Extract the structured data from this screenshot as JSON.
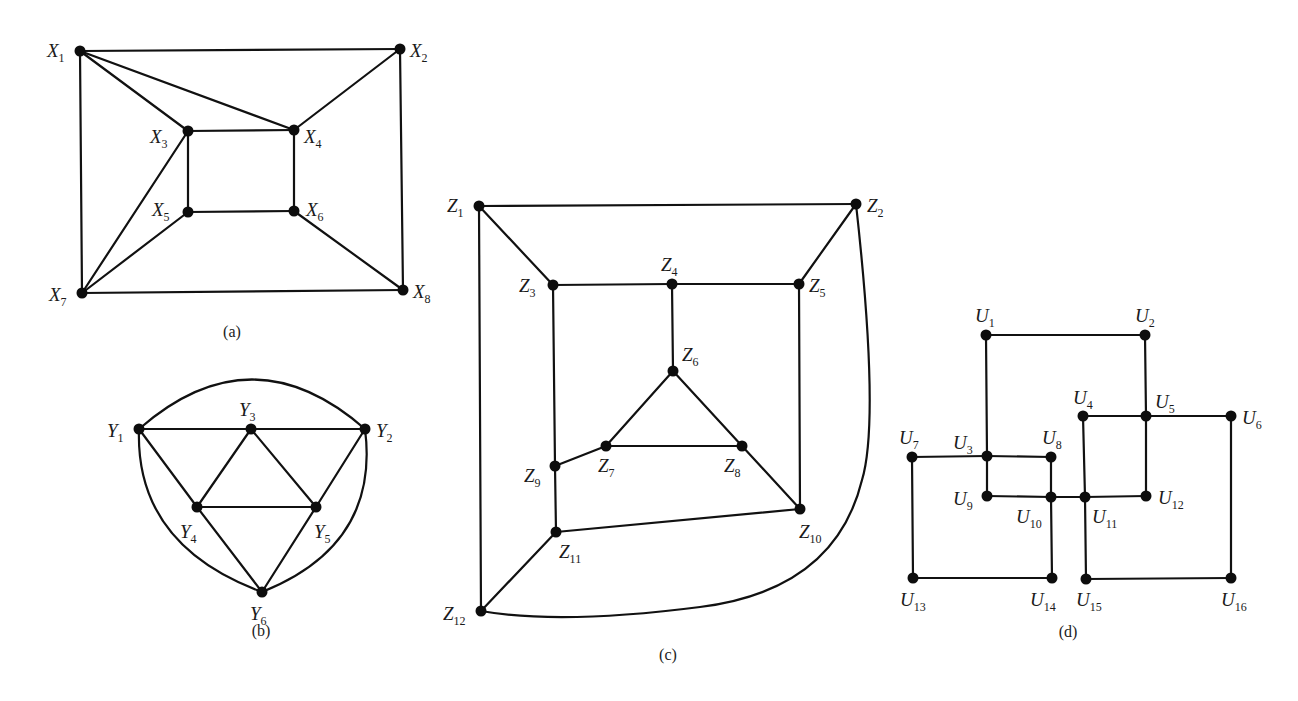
{
  "figure": {
    "graphs": [
      {
        "id": "a",
        "caption": "(a)",
        "caption_pos": [
          232,
          337
        ],
        "nodes": [
          {
            "name": "X",
            "sub": "1",
            "x": 80,
            "y": 51,
            "lx": 47,
            "ly": 57
          },
          {
            "name": "X",
            "sub": "2",
            "x": 400,
            "y": 49,
            "lx": 410,
            "ly": 57
          },
          {
            "name": "X",
            "sub": "3",
            "x": 188,
            "y": 131,
            "lx": 150,
            "ly": 143
          },
          {
            "name": "X",
            "sub": "4",
            "x": 294,
            "y": 130,
            "lx": 304,
            "ly": 143
          },
          {
            "name": "X",
            "sub": "5",
            "x": 188,
            "y": 212,
            "lx": 152,
            "ly": 216
          },
          {
            "name": "X",
            "sub": "6",
            "x": 294,
            "y": 211,
            "lx": 306,
            "ly": 216
          },
          {
            "name": "X",
            "sub": "7",
            "x": 82,
            "y": 293,
            "lx": 49,
            "ly": 301
          },
          {
            "name": "X",
            "sub": "8",
            "x": 403,
            "y": 290,
            "lx": 413,
            "ly": 298
          }
        ],
        "edges": [
          [
            0,
            1
          ],
          [
            0,
            2
          ],
          [
            0,
            3
          ],
          [
            0,
            6
          ],
          [
            1,
            3
          ],
          [
            1,
            7
          ],
          [
            2,
            3
          ],
          [
            2,
            4
          ],
          [
            2,
            6
          ],
          [
            3,
            5
          ],
          [
            4,
            5
          ],
          [
            4,
            6
          ],
          [
            5,
            7
          ],
          [
            6,
            7
          ]
        ]
      },
      {
        "id": "b",
        "caption": "(b)",
        "caption_pos": [
          261,
          636
        ],
        "nodes": [
          {
            "name": "Y",
            "sub": "1",
            "x": 139,
            "y": 429,
            "lx": 107,
            "ly": 437
          },
          {
            "name": "Y",
            "sub": "2",
            "x": 365,
            "y": 429,
            "lx": 376,
            "ly": 437
          },
          {
            "name": "Y",
            "sub": "3",
            "x": 251,
            "y": 429,
            "lx": 239,
            "ly": 416
          },
          {
            "name": "Y",
            "sub": "4",
            "x": 197,
            "y": 507,
            "lx": 180,
            "ly": 538
          },
          {
            "name": "Y",
            "sub": "5",
            "x": 316,
            "y": 507,
            "lx": 314,
            "ly": 538
          },
          {
            "name": "Y",
            "sub": "6",
            "x": 262,
            "y": 592,
            "lx": 250,
            "ly": 620
          }
        ],
        "edges": [
          [
            0,
            2
          ],
          [
            2,
            1
          ],
          [
            0,
            3
          ],
          [
            2,
            3
          ],
          [
            2,
            4
          ],
          [
            1,
            4
          ],
          [
            3,
            4
          ],
          [
            3,
            5
          ],
          [
            4,
            5
          ]
        ],
        "curves": [
          "M139,429 Q252,330 365,429",
          "M139,429 Q135,545 262,592",
          "M365,429 Q380,545 262,592"
        ]
      },
      {
        "id": "c",
        "caption": "(c)",
        "caption_pos": [
          668,
          660
        ],
        "nodes": [
          {
            "name": "Z",
            "sub": "1",
            "x": 479,
            "y": 206,
            "lx": 447,
            "ly": 212
          },
          {
            "name": "Z",
            "sub": "2",
            "x": 856,
            "y": 204,
            "lx": 867,
            "ly": 212
          },
          {
            "name": "Z",
            "sub": "3",
            "x": 553,
            "y": 285,
            "lx": 519,
            "ly": 292
          },
          {
            "name": "Z",
            "sub": "4",
            "x": 672,
            "y": 284,
            "lx": 661,
            "ly": 271
          },
          {
            "name": "Z",
            "sub": "5",
            "x": 799,
            "y": 284,
            "lx": 809,
            "ly": 292
          },
          {
            "name": "Z",
            "sub": "6",
            "x": 673,
            "y": 371,
            "lx": 682,
            "ly": 361
          },
          {
            "name": "Z",
            "sub": "7",
            "x": 606,
            "y": 446,
            "lx": 598,
            "ly": 472
          },
          {
            "name": "Z",
            "sub": "8",
            "x": 742,
            "y": 446,
            "lx": 724,
            "ly": 472
          },
          {
            "name": "Z",
            "sub": "9",
            "x": 555,
            "y": 466,
            "lx": 524,
            "ly": 482
          },
          {
            "name": "Z",
            "sub": "10",
            "x": 800,
            "y": 509,
            "lx": 799,
            "ly": 538
          },
          {
            "name": "Z",
            "sub": "11",
            "x": 556,
            "y": 532,
            "lx": 559,
            "ly": 558
          },
          {
            "name": "Z",
            "sub": "12",
            "x": 481,
            "y": 611,
            "lx": 443,
            "ly": 620
          }
        ],
        "edges": [
          [
            0,
            1
          ],
          [
            0,
            2
          ],
          [
            0,
            11
          ],
          [
            1,
            4
          ],
          [
            2,
            3
          ],
          [
            3,
            4
          ],
          [
            2,
            8
          ],
          [
            3,
            5
          ],
          [
            4,
            9
          ],
          [
            5,
            6
          ],
          [
            5,
            7
          ],
          [
            6,
            7
          ],
          [
            6,
            8
          ],
          [
            7,
            9
          ],
          [
            8,
            10
          ],
          [
            9,
            10
          ],
          [
            10,
            11
          ]
        ],
        "curves": [
          "M856,204 Q880,420 862,480 Q835,590 700,607 Q560,625 481,611"
        ]
      },
      {
        "id": "d",
        "caption": "(d)",
        "caption_pos": [
          1068,
          637
        ],
        "nodes": [
          {
            "name": "U",
            "sub": "1",
            "x": 986,
            "y": 335,
            "lx": 975,
            "ly": 322
          },
          {
            "name": "U",
            "sub": "2",
            "x": 1145,
            "y": 335,
            "lx": 1135,
            "ly": 322
          },
          {
            "name": "U",
            "sub": "3",
            "x": 987,
            "y": 456,
            "lx": 953,
            "ly": 449
          },
          {
            "name": "U",
            "sub": "4",
            "x": 1083,
            "y": 416,
            "lx": 1073,
            "ly": 404
          },
          {
            "name": "U",
            "sub": "5",
            "x": 1146,
            "y": 416,
            "lx": 1155,
            "ly": 408
          },
          {
            "name": "U",
            "sub": "6",
            "x": 1231,
            "y": 416,
            "lx": 1242,
            "ly": 424
          },
          {
            "name": "U",
            "sub": "7",
            "x": 912,
            "y": 457,
            "lx": 899,
            "ly": 444
          },
          {
            "name": "U",
            "sub": "8",
            "x": 1051,
            "y": 457,
            "lx": 1042,
            "ly": 444
          },
          {
            "name": "U",
            "sub": "9",
            "x": 987,
            "y": 496,
            "lx": 953,
            "ly": 505
          },
          {
            "name": "U",
            "sub": "10",
            "x": 1051,
            "y": 497,
            "lx": 1016,
            "ly": 523
          },
          {
            "name": "U",
            "sub": "11",
            "x": 1085,
            "y": 497,
            "lx": 1092,
            "ly": 523
          },
          {
            "name": "U",
            "sub": "12",
            "x": 1146,
            "y": 496,
            "lx": 1158,
            "ly": 504
          },
          {
            "name": "U",
            "sub": "13",
            "x": 913,
            "y": 578,
            "lx": 900,
            "ly": 606
          },
          {
            "name": "U",
            "sub": "14",
            "x": 1052,
            "y": 578,
            "lx": 1030,
            "ly": 606
          },
          {
            "name": "U",
            "sub": "15",
            "x": 1086,
            "y": 579,
            "lx": 1076,
            "ly": 606
          },
          {
            "name": "U",
            "sub": "16",
            "x": 1231,
            "y": 578,
            "lx": 1221,
            "ly": 606
          }
        ],
        "edges": [
          [
            0,
            1
          ],
          [
            0,
            2
          ],
          [
            1,
            4
          ],
          [
            2,
            6
          ],
          [
            2,
            7
          ],
          [
            2,
            8
          ],
          [
            3,
            4
          ],
          [
            4,
            5
          ],
          [
            3,
            10
          ],
          [
            4,
            11
          ],
          [
            5,
            15
          ],
          [
            6,
            12
          ],
          [
            7,
            9
          ],
          [
            8,
            9
          ],
          [
            9,
            10
          ],
          [
            10,
            11
          ],
          [
            9,
            13
          ],
          [
            12,
            13
          ],
          [
            10,
            14
          ],
          [
            14,
            15
          ]
        ]
      }
    ]
  }
}
